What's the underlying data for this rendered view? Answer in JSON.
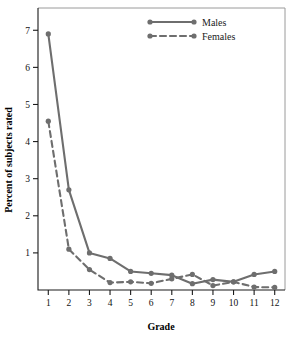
{
  "chart_data": {
    "type": "line",
    "title": "",
    "xlabel": "Grade",
    "ylabel": "Percent of subjects rated",
    "x": [
      1,
      2,
      3,
      4,
      5,
      6,
      7,
      8,
      9,
      10,
      11,
      12
    ],
    "categories": [
      "1",
      "2",
      "3",
      "4",
      "5",
      "6",
      "7",
      "8",
      "9",
      "10",
      "11",
      "12"
    ],
    "xtick_labels": [
      "1",
      "2",
      "3",
      "4",
      "5",
      "6",
      "7",
      "8",
      "9",
      "10",
      "11",
      "12"
    ],
    "ytick_labels": [
      "1",
      "2",
      "3",
      "4",
      "5",
      "6",
      "7"
    ],
    "yticks": [
      1,
      2,
      3,
      4,
      5,
      6,
      7
    ],
    "xlim": [
      0.5,
      12.5
    ],
    "ylim": [
      0,
      7.6
    ],
    "grid": false,
    "legend_position": "top-center",
    "series": [
      {
        "name": "Males",
        "style": "solid",
        "color": "#6e6e6e",
        "values": [
          6.9,
          2.7,
          1.0,
          0.85,
          0.5,
          0.45,
          0.4,
          0.17,
          0.28,
          0.22,
          0.42,
          0.5
        ]
      },
      {
        "name": "Females",
        "style": "dashed",
        "color": "#6e6e6e",
        "values": [
          4.55,
          1.1,
          0.55,
          0.2,
          0.22,
          0.18,
          0.3,
          0.42,
          0.12,
          0.22,
          0.08,
          0.07
        ]
      }
    ]
  },
  "legend": {
    "entries": [
      {
        "label": "Males"
      },
      {
        "label": "Females"
      }
    ]
  },
  "axes": {
    "x_title": "Grade",
    "y_title": "Percent of subjects rated"
  },
  "colors": {
    "series": "#6e6e6e",
    "axis": "#1a1a1a",
    "frame": "#9a9a9a",
    "background": "#ffffff"
  }
}
